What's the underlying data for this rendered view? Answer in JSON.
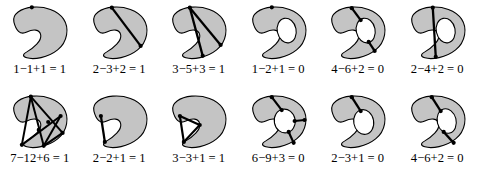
{
  "figure": {
    "colors": {
      "fill": "#c4c4c4",
      "hole_fill": "#ffffff",
      "outline": "#000000",
      "edge": "#000000",
      "vertex": "#000000",
      "background": "#ffffff"
    },
    "rows": [
      {
        "row_index": 0,
        "cells": [
          {
            "id": "disk-1",
            "shape": "disk",
            "caption": "1−1+1 = 1",
            "vertices": 1,
            "edges": 1,
            "faces": 1,
            "euler_characteristic": 1
          },
          {
            "id": "disk-2",
            "shape": "disk",
            "caption": "2−3+2 = 1",
            "vertices": 2,
            "edges": 3,
            "faces": 2,
            "euler_characteristic": 1
          },
          {
            "id": "disk-3",
            "shape": "disk",
            "caption": "3−5+3 = 1",
            "vertices": 3,
            "edges": 5,
            "faces": 3,
            "euler_characteristic": 1
          },
          {
            "id": "annulus-1",
            "shape": "annulus",
            "caption": "1−2+1 = 0",
            "vertices": 1,
            "edges": 2,
            "faces": 1,
            "euler_characteristic": 0
          },
          {
            "id": "annulus-2",
            "shape": "annulus",
            "caption": "4−6+2 = 0",
            "vertices": 4,
            "edges": 6,
            "faces": 2,
            "euler_characteristic": 0
          },
          {
            "id": "annulus-3",
            "shape": "annulus",
            "caption": "2−4+2 = 0",
            "vertices": 2,
            "edges": 4,
            "faces": 2,
            "euler_characteristic": 0
          }
        ]
      },
      {
        "row_index": 1,
        "cells": [
          {
            "id": "disk-4",
            "shape": "disk",
            "caption": "7−12+6 = 1",
            "vertices": 7,
            "edges": 12,
            "faces": 6,
            "euler_characteristic": 1
          },
          {
            "id": "disk-5",
            "shape": "disk",
            "caption": "2−2+1 = 1",
            "vertices": 2,
            "edges": 2,
            "faces": 1,
            "euler_characteristic": 1
          },
          {
            "id": "disk-6",
            "shape": "disk",
            "caption": "3−3+1 = 1",
            "vertices": 3,
            "edges": 3,
            "faces": 1,
            "euler_characteristic": 1
          },
          {
            "id": "annulus-4",
            "shape": "annulus",
            "caption": "6−9+3 = 0",
            "vertices": 6,
            "edges": 9,
            "faces": 3,
            "euler_characteristic": 0
          },
          {
            "id": "annulus-5",
            "shape": "annulus",
            "caption": "2−3+1 = 0",
            "vertices": 2,
            "edges": 3,
            "faces": 1,
            "euler_characteristic": 0
          },
          {
            "id": "annulus-6",
            "shape": "annulus",
            "caption": "4−6+2 = 0",
            "vertices": 4,
            "edges": 6,
            "faces": 2,
            "euler_characteristic": 0
          }
        ]
      }
    ]
  }
}
